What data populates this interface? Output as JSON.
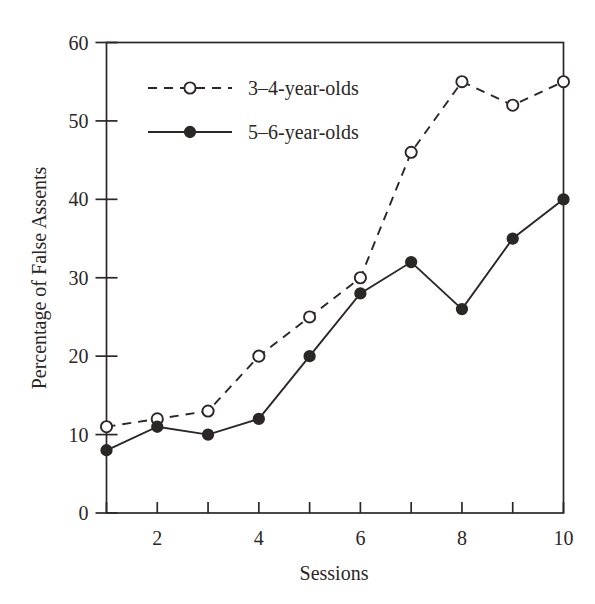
{
  "chart_data": {
    "type": "line",
    "title": "",
    "subtitle": "",
    "xlabel": "Sessions",
    "ylabel": "Percentage of False Assents",
    "x": [
      1,
      2,
      3,
      4,
      5,
      6,
      7,
      8,
      9,
      10
    ],
    "xlim": [
      1,
      10
    ],
    "ylim": [
      0,
      60
    ],
    "xticks": [
      1,
      2,
      3,
      4,
      5,
      6,
      7,
      8,
      9,
      10
    ],
    "xtick_labels": [
      "",
      "2",
      "",
      "4",
      "",
      "6",
      "",
      "8",
      "",
      "10"
    ],
    "yticks": [
      0,
      10,
      20,
      30,
      40,
      50,
      60
    ],
    "ytick_labels": [
      "0",
      "10",
      "20",
      "30",
      "40",
      "50",
      "60"
    ],
    "grid": false,
    "legend_position": "upper left inside",
    "series": [
      {
        "name": "3–4-year-olds",
        "values": [
          11,
          12,
          13,
          20,
          25,
          30,
          46,
          55,
          52,
          55
        ],
        "line_style": "dashed",
        "marker": "open-circle",
        "color": "#2b2726"
      },
      {
        "name": "5–6-year-olds",
        "values": [
          8,
          11,
          10,
          12,
          20,
          28,
          32,
          26,
          35,
          40
        ],
        "line_style": "solid",
        "marker": "filled-circle",
        "color": "#2b2726"
      }
    ]
  },
  "figure": {
    "background_color": "#ffffff",
    "axis_color": "#2b2726",
    "text_color": "#2b2726"
  },
  "legend": {
    "entries": [
      {
        "label": "3–4-year-olds",
        "marker": "open-circle",
        "line_style": "dashed"
      },
      {
        "label": "5–6-year-olds",
        "marker": "filled-circle",
        "line_style": "solid"
      }
    ]
  }
}
